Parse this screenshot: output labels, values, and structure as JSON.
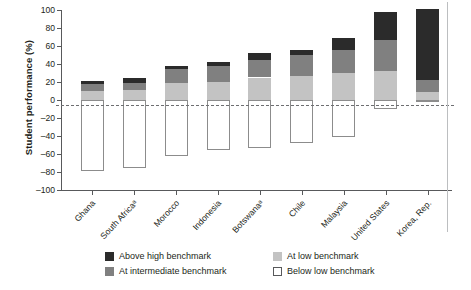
{
  "chart_data": {
    "type": "bar",
    "subtype": "stacked-diverging",
    "title": "",
    "xlabel": "",
    "ylabel": "Student performance (%)",
    "ylim": [
      -100,
      100
    ],
    "yticks": [
      100,
      80,
      60,
      40,
      20,
      0,
      -20,
      -40,
      -60,
      -80,
      -100
    ],
    "ytick_labels": [
      "100",
      "80",
      "60",
      "40",
      "20",
      "0",
      "–20",
      "–40",
      "–60",
      "–80",
      "–100"
    ],
    "grid": false,
    "zero_reference_line": true,
    "legend_position": "bottom",
    "categories": [
      "Ghana",
      "South Africaᵃ",
      "Morocco",
      "Indonesia",
      "Botswanaᵃ",
      "Chile",
      "Malaysia",
      "United States",
      "Korea, Rep."
    ],
    "series": [
      {
        "name": "Above high benchmark",
        "color": "#2b2b2b",
        "values": [
          3,
          5,
          4,
          4,
          8,
          6,
          13,
          31,
          79
        ]
      },
      {
        "name": "At intermediate benchmark",
        "color": "#808080",
        "values": [
          8,
          8,
          15,
          18,
          19,
          23,
          26,
          35,
          13
        ]
      },
      {
        "name": "At low benchmark",
        "color": "#c3c3c3",
        "values": [
          10,
          11,
          19,
          20,
          25,
          27,
          30,
          32,
          9
        ]
      },
      {
        "name": "Below low benchmark",
        "color": "#ffffff",
        "values": [
          -79,
          -76,
          -62,
          -55,
          -53,
          -48,
          -41,
          -10,
          -2
        ]
      }
    ],
    "totals_positive": [
      21,
      24,
      38,
      42,
      52,
      56,
      69,
      98,
      101
    ]
  },
  "legend": {
    "items": [
      {
        "label": "Above high benchmark",
        "swatch": "sw-above"
      },
      {
        "label": "At low benchmark",
        "swatch": "sw-low"
      },
      {
        "label": "At intermediate benchmark",
        "swatch": "sw-inter"
      },
      {
        "label": "Below low benchmark",
        "swatch": "sw-below"
      }
    ]
  }
}
